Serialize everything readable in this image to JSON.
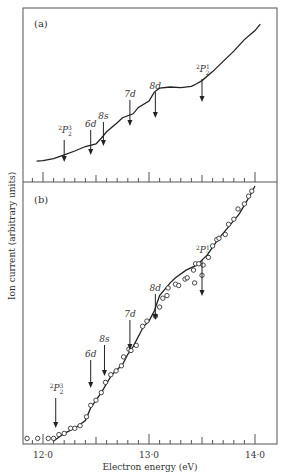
{
  "chart_data": [
    {
      "panel": "(a)",
      "type": "line",
      "xlabel": "Electron energy (eV)",
      "ylabel": "Ion current (arbitrary units)",
      "xlim": [
        11.8,
        14.2
      ],
      "ylim": [
        0,
        100
      ],
      "x_ticks": [
        12.0,
        13.0,
        14.0
      ],
      "x_minor_step": 0.1,
      "series": [
        {
          "name": "ion current (a)",
          "x": [
            11.94,
            12.0,
            12.1,
            12.2,
            12.3,
            12.4,
            12.5,
            12.55,
            12.6,
            12.7,
            12.75,
            12.85,
            12.9,
            13.0,
            13.05,
            13.1,
            13.2,
            13.3,
            13.4,
            13.45,
            13.5,
            13.6,
            13.7,
            13.8,
            13.9,
            14.0,
            14.05
          ],
          "y": [
            10,
            10.5,
            12,
            15,
            18,
            21.5,
            23.5,
            28,
            33,
            40,
            44,
            47,
            52,
            57,
            64,
            67,
            68,
            67.5,
            68.5,
            70.5,
            73,
            80,
            88,
            96,
            105,
            112,
            117
          ]
        }
      ],
      "annotations": [
        {
          "label": "2P3/2",
          "x": 12.2
        },
        {
          "label": "6d",
          "x": 12.45
        },
        {
          "label": "8s",
          "x": 12.57
        },
        {
          "label": "7d",
          "x": 12.8
        },
        {
          "label": "8d",
          "x": 13.06
        },
        {
          "label": "2P1/2",
          "x": 13.5
        }
      ]
    },
    {
      "panel": "(b)",
      "type": "scatter",
      "xlabel": "Electron energy (eV)",
      "ylabel": "Ion current (arbitrary units)",
      "xlim": [
        11.8,
        14.2
      ],
      "ylim": [
        0,
        100
      ],
      "x_ticks": [
        12.0,
        13.0,
        14.0
      ],
      "x_tick_labels": [
        "12·0",
        "13·0",
        "14·0"
      ],
      "x_minor_step": 0.1,
      "series": [
        {
          "name": "measured points",
          "x": [
            11.85,
            11.95,
            12.05,
            12.1,
            12.15,
            12.2,
            12.26,
            12.3,
            12.35,
            12.41,
            12.45,
            12.5,
            12.55,
            12.59,
            12.64,
            12.69,
            12.74,
            12.76,
            12.81,
            12.83,
            12.88,
            12.94,
            12.98,
            13.06,
            13.1,
            13.13,
            13.18,
            13.25,
            13.28,
            13.34,
            13.36,
            13.42,
            13.44,
            13.47,
            13.51,
            13.56,
            13.6,
            13.64,
            13.66,
            13.72,
            13.75,
            13.8,
            13.84,
            13.9,
            13.94,
            13.97
          ],
          "y": [
            1,
            1,
            1,
            1,
            2.5,
            3,
            5,
            5,
            6,
            9.5,
            14,
            16,
            19,
            23,
            26,
            27.5,
            29.5,
            33,
            36,
            35.5,
            37.5,
            45,
            47,
            49,
            52.5,
            56,
            60,
            61.5,
            61,
            63.5,
            64,
            67,
            69.5,
            69.5,
            69,
            72,
            76.5,
            79,
            79.5,
            81,
            85,
            87,
            91,
            93,
            96,
            98
          ]
        },
        {
          "name": "fitted curve",
          "x": [
            12.1,
            12.2,
            12.3,
            12.4,
            12.45,
            12.55,
            12.65,
            12.75,
            12.8,
            12.85,
            12.95,
            13.0,
            13.05,
            13.1,
            13.2,
            13.25,
            13.35,
            13.45,
            13.55,
            13.65,
            13.75,
            13.85,
            13.95,
            14.0
          ],
          "y": [
            0,
            3,
            5,
            8,
            13,
            19,
            26,
            30,
            34,
            37,
            45,
            47,
            51,
            57,
            62,
            64,
            67,
            69,
            73,
            79,
            84,
            89,
            96,
            100
          ]
        }
      ],
      "outlier_points": {
        "x": [
          13.17,
          13.43,
          13.5
        ],
        "y": [
          57,
          62,
          65
        ]
      },
      "annotations": [
        {
          "label": "2P3/2",
          "x": 12.12
        },
        {
          "label": "6d",
          "x": 12.45
        },
        {
          "label": "8s",
          "x": 12.58
        },
        {
          "label": "7d",
          "x": 12.82
        },
        {
          "label": "8d",
          "x": 13.06
        },
        {
          "label": "2P1/2",
          "x": 13.5
        }
      ]
    }
  ],
  "labels": {
    "panel_a": "(a)",
    "panel_b": "(b)",
    "ylabel": "Ion current (arbitrary units)",
    "xlabel": "Electron energy (eV)",
    "tick_12": "12·0",
    "tick_13": "13·0",
    "tick_14": "14·0"
  },
  "annotation_text": {
    "p32_sup": "2",
    "p_letter": "P",
    "frac_top_32": "3",
    "frac_top_12": "1",
    "frac_bot": "2",
    "d6": "6d",
    "s8": "8s",
    "d7": "7d",
    "d8": "8d"
  }
}
